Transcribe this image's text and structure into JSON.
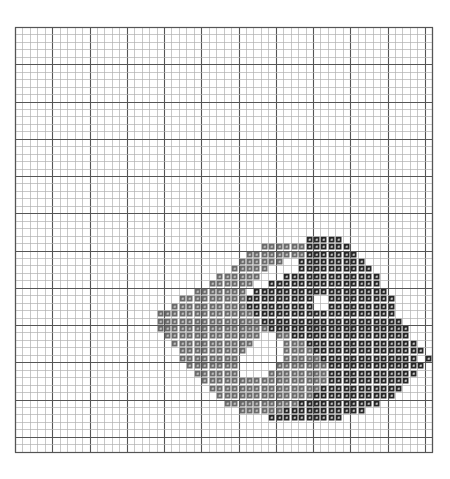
{
  "document": {
    "title": "Cross Stitch Pattern Chart",
    "type": "counted-cross-stitch-chart",
    "background_color": "#ffffff"
  },
  "chart_data": {
    "type": "heatmap",
    "title": "Cross Stitch Pattern Chart",
    "subtitle": "",
    "xlabel": "",
    "ylabel": "",
    "grid": true,
    "legend_position": "none",
    "columns": 56,
    "rows": 57,
    "cell_size_px": 7.45,
    "origin_x_px": 15,
    "origin_y_px": 27,
    "bold_line_every": 5,
    "colors": {
      "background": "#ffffff",
      "thin_line": "#b0b0b0",
      "bold_line": "#555555",
      "border": "#555555",
      "symbol_dark": "#262626",
      "symbol_mid": "#6b6b6b",
      "symbol_glyph_light": "#d8d8d8",
      "symbol_glyph_dark": "#f2f2f2"
    },
    "legend_entries": [
      {
        "key": "D",
        "label": "dark",
        "color": "#262626",
        "glyph": "filled-square"
      },
      {
        "key": "M",
        "label": "medium",
        "color": "#6b6b6b",
        "glyph": "cross-symbol"
      },
      {
        "key": ".",
        "label": "empty",
        "color": "#ffffff",
        "glyph": "none"
      }
    ],
    "x": [
      1,
      2,
      3,
      4,
      5,
      6,
      7,
      8,
      9,
      10,
      11,
      12,
      13,
      14,
      15,
      16,
      17,
      18,
      19,
      20,
      21,
      22,
      23,
      24,
      25,
      26,
      27,
      28,
      29,
      30,
      31,
      32,
      33,
      34,
      35,
      36,
      37,
      38,
      39,
      40,
      41,
      42,
      43,
      44,
      45,
      46,
      47,
      48,
      49,
      50,
      51,
      52,
      53,
      54,
      55,
      56
    ],
    "xlim": [
      1,
      56
    ],
    "ylim": [
      1,
      57
    ],
    "pattern_key": {
      "empty": ".",
      "mid": "M",
      "dark": "D"
    },
    "pattern_rows": [
      "........................................................",
      "........................................................",
      "........................................................",
      "........................................................",
      "........................................................",
      "........................................................",
      "........................................................",
      "........................................................",
      "........................................................",
      "........................................................",
      "........................................................",
      "........................................................",
      "........................................................",
      "........................................................",
      "........................................................",
      "........................................................",
      "........................................................",
      "........................................................",
      "........................................................",
      "........................................................",
      "........................................................",
      "........................................................",
      "........................................................",
      "........................................................",
      "........................................................",
      "........................................................",
      "........................................................",
      "........................................................",
      ".......................................DDDDD............",
      ".................................MMMMMMDDDDDD...........",
      "...............................MMMMMMMMDDDDDDD..........",
      "..............................MMMMMM..DDDDDDDDD.........",
      ".............................MMMMM....DDDDDDDDDD........",
      "...........................MMMMMM...DDDDDDDDDDDDD.......",
      "..........................MMMMMM..DDDDDDDDDDDDDDD.......",
      "........................MMMMMMM.DDDDDDDDDDDDDDDDDD......",
      "......................MMMMMMMMMDDDDDDDDD..DDDDDDDDD.....",
      ".....................MMMMMMMMMMDDDDDDDDD..DDDDDDDDD.....",
      "...................MMMMMMMMMMMMMDDDDDDDDDDDDDDDDDDD.....",
      "...................MMMMMMMMMMMMMMDDDDDDDDDDDDDDDDDDD....",
      "...................MMMMMMMMMMMMMMMDDDDDDDDDDDDDDDDDDD...",
      "....................MMMMMMMMMMMMM..MMDDDDDDDDDDDDDDDD...",
      ".....................MMMMMMMMMMM....MMMDDDDDDDDDDDDDDD..",
      "......................MMMMMMMMM.....MMMMDDDDDDDDDDDDDDD.",
      "......................MMMMMMMM......MMMMMDDDDDDDDDDDDD.D",
      ".......................MMMMMMM.....MMMMMMMDDDDDDDDDDDDD.",
      "........................MMMMMM....MMMMMMMMDDDDDDDDDDDD..",
      ".........................MMMMMMMMMMMMMMMMMDDDDDDDDDDD...",
      "..........................MMMMMMMMMMMMMMMDDDDDDDDDDD....",
      "...........................MMMMMMMMMMMMMDDDDDDDDDDD.....",
      "............................MMMMMMMMMMDDDDDDDDDDD.......",
      "..............................MMMMMMDDDDDDDDDDD.........",
      "..................................DDDDDDDDDD............",
      "........................................................",
      "........................................................",
      "........................................................",
      "........................................................"
    ]
  }
}
